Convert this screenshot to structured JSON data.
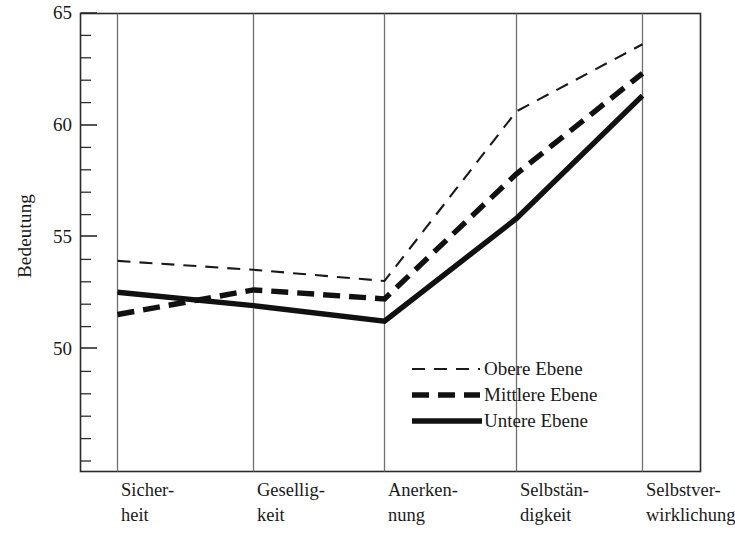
{
  "chart_data": {
    "type": "line",
    "title": "",
    "xlabel": "",
    "ylabel": "Bedeutung",
    "ylim": [
      46.0,
      65.0
    ],
    "yticks": [
      50,
      55,
      60,
      65
    ],
    "ytick_labels": [
      "50",
      "55",
      "60",
      "65"
    ],
    "minor_tick_step": 1,
    "grid": "vertical category lines only",
    "legend_position": "inside lower-right",
    "categories": [
      "Sicher-\nheit",
      "Gesellig-\nkeit",
      "Anerken-\nnung",
      "Selbstän-\ndigkeit",
      "Selbstver-\nwirklichung"
    ],
    "categories_plain": [
      "Sicherheit",
      "Geselligkeit",
      "Anerkennung",
      "Selbständigkeit",
      "Selbstverwirklichung"
    ],
    "series": [
      {
        "name": "Obere Ebene",
        "style": "thin-dashed",
        "color": "#1a1a1a",
        "values": [
          53.9,
          53.5,
          53.0,
          60.6,
          63.6
        ]
      },
      {
        "name": "Mittlere Ebene",
        "style": "thick-dashed",
        "color": "#111111",
        "values": [
          51.5,
          52.6,
          52.2,
          57.8,
          62.3
        ]
      },
      {
        "name": "Untere Ebene",
        "style": "thick-solid",
        "color": "#111111",
        "values": [
          52.5,
          51.9,
          51.2,
          55.8,
          61.3
        ]
      }
    ]
  },
  "axis": {
    "y_title": "Bedeutung",
    "y_tick_labels": [
      "65",
      "60",
      "55",
      "50"
    ]
  },
  "legend": {
    "items": [
      {
        "label": "Obere Ebene"
      },
      {
        "label": "Mittlere Ebene"
      },
      {
        "label": "Untere Ebene"
      }
    ]
  },
  "colors": {
    "axis": "#2b2b2b",
    "gridline": "#6e6e6e",
    "ink": "#111111",
    "background": "#ffffff"
  }
}
